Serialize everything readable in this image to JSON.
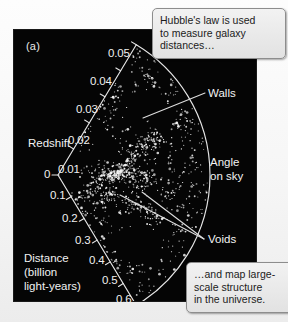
{
  "figure": {
    "panel_tag": "(a)",
    "type": "redshift-survey-wedge"
  },
  "axes": {
    "redshift": {
      "title": "Redshift",
      "ticks": [
        "0.05",
        "0.04",
        "0.03",
        "0.02",
        "0.01"
      ]
    },
    "distance": {
      "title_line1": "Distance",
      "title_line2": "(billion",
      "title_line3": "light-years)",
      "origin_tick": "0",
      "ticks": [
        "0.1",
        "0.2",
        "0.3",
        "0.4",
        "0.5",
        "0.6"
      ]
    },
    "angle": {
      "title_line1": "Angle",
      "title_line2": "on sky"
    }
  },
  "annotations": {
    "walls": "Walls",
    "voids": "Voids"
  },
  "callouts": {
    "top": {
      "line1": "Hubble's law is used",
      "line2": "to measure galaxy",
      "line3": "distances…"
    },
    "bottom": {
      "line1": "…and map large-",
      "line2": "scale structure",
      "line3": "in the universe."
    }
  },
  "colors": {
    "panel_background": "#050505",
    "axis_line": "#e8e8e8",
    "label_text": "#f0f0f0",
    "callout_background": "#ececec",
    "callout_border": "#8d8d8d",
    "galaxy_point": "#f5f5f5"
  },
  "chart_data": {
    "type": "scatter",
    "title": "",
    "xlabel": "Angle on sky",
    "ylabel": "Redshift / Distance (billion light-years)",
    "projection": "polar-wedge",
    "grid": false,
    "legend": "none",
    "apex": {
      "x": 58,
      "y": 175
    },
    "wedge": {
      "radius_px": 152,
      "angle_start_deg": -59,
      "angle_end_deg": 59
    },
    "radial_axis_redshift": {
      "values": [
        0,
        0.01,
        0.02,
        0.03,
        0.04,
        0.05
      ],
      "labels": [
        "0",
        "0.01",
        "0.02",
        "0.03",
        "0.04",
        "0.05"
      ],
      "range": [
        0,
        0.05
      ]
    },
    "radial_axis_distance": {
      "values": [
        0,
        0.1,
        0.2,
        0.3,
        0.4,
        0.5,
        0.6
      ],
      "labels": [
        "0",
        "0.1",
        "0.2",
        "0.3",
        "0.4",
        "0.5",
        "0.6"
      ],
      "range": [
        0,
        0.6
      ],
      "units": "billion light-years"
    },
    "annotations": [
      {
        "label": "Walls",
        "points_to": "dense filamentary chains of galaxies"
      },
      {
        "label": "Voids",
        "points_to": "empty regions between filaments"
      }
    ],
    "structures": [
      {
        "name": "central-filament",
        "type": "wall",
        "r_frac": 0.42,
        "theta_deg": 2,
        "length_frac": 0.36,
        "orientation_deg": 4,
        "density": "high"
      },
      {
        "name": "upper-wall",
        "type": "wall",
        "r_frac": 0.58,
        "theta_deg": 18,
        "length_frac": 0.3,
        "orientation_deg": -42,
        "density": "high"
      },
      {
        "name": "lower-wall",
        "type": "wall",
        "r_frac": 0.6,
        "theta_deg": -22,
        "length_frac": 0.3,
        "orientation_deg": 38,
        "density": "medium"
      },
      {
        "name": "left-spur",
        "type": "wall",
        "r_frac": 0.3,
        "theta_deg": -20,
        "length_frac": 0.22,
        "orientation_deg": 20,
        "density": "medium"
      },
      {
        "name": "void-upper",
        "type": "void",
        "r_frac": 0.72,
        "theta_deg": 34,
        "radius_frac": 0.17
      },
      {
        "name": "void-lower",
        "type": "void",
        "r_frac": 0.66,
        "theta_deg": -38,
        "radius_frac": 0.17
      },
      {
        "name": "void-near",
        "type": "void",
        "r_frac": 0.3,
        "theta_deg": 30,
        "radius_frac": 0.12
      }
    ],
    "n_points_approx": 980,
    "point_color": "#f5f5f5"
  }
}
